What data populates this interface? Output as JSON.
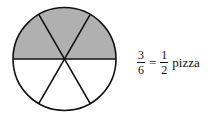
{
  "diagram": {
    "shape": "circle-divided-into-sixths",
    "total_slices": 6,
    "shaded_slices": 3,
    "shaded_region": "top-half",
    "colors": {
      "shaded": "#b0b0b0",
      "unshaded": "#ffffff",
      "stroke": "#111111"
    }
  },
  "equation": {
    "left_fraction": {
      "numerator": "3",
      "denominator": "6"
    },
    "equals": "=",
    "right_fraction": {
      "numerator": "1",
      "denominator": "2"
    },
    "unit": "pizza"
  }
}
